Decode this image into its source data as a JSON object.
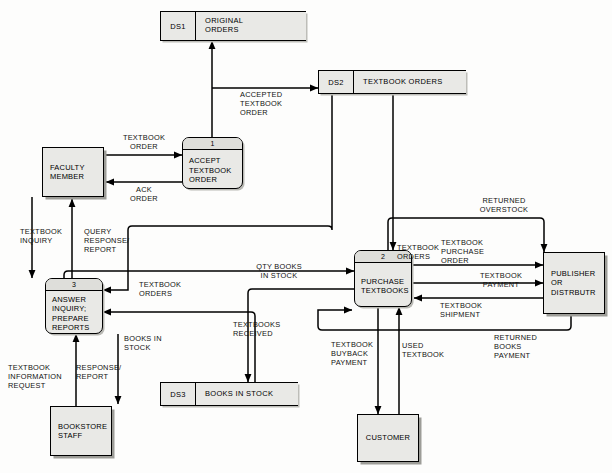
{
  "diagram": {
    "type": "data-flow-diagram"
  },
  "data_stores": [
    {
      "id": "DS1",
      "name": "ORIGINAL\nORDERS"
    },
    {
      "id": "DS2",
      "name": "TEXTBOOK ORDERS"
    },
    {
      "id": "DS3",
      "name": "BOOKS IN STOCK"
    }
  ],
  "processes": [
    {
      "number": "1",
      "name": "ACCEPT\nTEXTBOOK\nORDER"
    },
    {
      "number": "2",
      "name": "PURCHASE\nTEXTBOOKS"
    },
    {
      "number": "3",
      "name": "ANSWER\nINQUIRY;\nPREPARE\nREPORTS"
    }
  ],
  "entities": [
    {
      "key": "faculty",
      "name": "FACULTY\nMEMBER"
    },
    {
      "key": "bookstore",
      "name": "BOOKSTORE\nSTAFF"
    },
    {
      "key": "customer",
      "name": "CUSTOMER"
    },
    {
      "key": "publisher",
      "name": "PUBLISHER\nOR\nDISTRBUTR"
    }
  ],
  "flows": [
    {
      "key": "textbook_order",
      "label": "TEXTBOOK\nORDER"
    },
    {
      "key": "ack_order",
      "label": "ACK\nORDER"
    },
    {
      "key": "accepted_textbook_order",
      "label": "ACCEPTED\nTEXTBOOK\nORDER"
    },
    {
      "key": "textbook_inquiry",
      "label": "TEXTBOOK\nINQUIRY"
    },
    {
      "key": "query_response_report",
      "label": "QUERY\nRESPONSE/\nREPORT"
    },
    {
      "key": "textbook_orders_ds2",
      "label": "TEXTBOOK\nORDERS"
    },
    {
      "key": "textbook_orders_p3",
      "label": "TEXTBOOK\nORDERS"
    },
    {
      "key": "qty_books_in_stock",
      "label": "QTY BOOKS\nIN STOCK"
    },
    {
      "key": "books_in_stock",
      "label": "BOOKS IN\nSTOCK"
    },
    {
      "key": "textbooks_received",
      "label": "TEXTBOOKS\nRECEIVED"
    },
    {
      "key": "textbook_information_request",
      "label": "TEXTBOOK\nINFORMATION\nREQUEST"
    },
    {
      "key": "response_report",
      "label": "RESPONSE/\nREPORT"
    },
    {
      "key": "textbook_buyback_payment",
      "label": "TEXTBOOK\nBUYBACK\nPAYMENT"
    },
    {
      "key": "used_textbook",
      "label": "USED\nTEXTBOOK"
    },
    {
      "key": "textbook_purchase_order",
      "label": "TEXTBOOK\nPURCHASE\nORDER"
    },
    {
      "key": "textbook_payment",
      "label": "TEXTBOOK\nPAYMENT"
    },
    {
      "key": "textbook_shipment",
      "label": "TEXTBOOK\nSHIPMENT"
    },
    {
      "key": "returned_overstock",
      "label": "RETURNED\nOVERSTOCK"
    },
    {
      "key": "returned_books_payment",
      "label": "RETURNED\nBOOKS\nPAYMENT"
    }
  ],
  "colors": {
    "stroke": "#000000",
    "shape_fill": "#e9e9e6",
    "process_banner_fill": "#dededa",
    "shadow": "#9d9d98",
    "background": "#fdfdfc"
  }
}
